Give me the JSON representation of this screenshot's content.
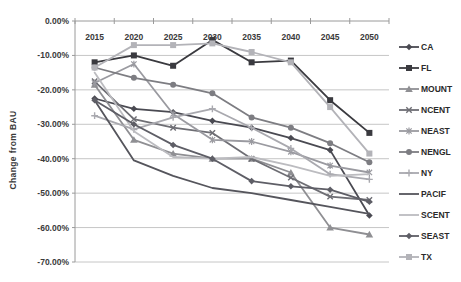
{
  "figure": {
    "background": "#ffffff",
    "grid_color": "#c6c6c6",
    "axis_color": "#9a9a9a",
    "tick_label_color": "#3a3a3a"
  },
  "chart_data": {
    "type": "line",
    "title": "",
    "xlabel": "",
    "ylabel": "Change from BAU",
    "x": [
      "2015",
      "2020",
      "2025",
      "2030",
      "2035",
      "2040",
      "2045",
      "2050"
    ],
    "y_ticks": [
      "0.00%",
      "-10.00%",
      "-20.00%",
      "-30.00%",
      "-40.00%",
      "-50.00%",
      "-60.00%",
      "-70.00%"
    ],
    "ylim": [
      -70,
      0
    ],
    "grid": "horizontal",
    "legend_position": "right",
    "series": [
      {
        "name": "CA",
        "marker": "diamond",
        "color": "#4a4a52",
        "values": [
          -22.5,
          -25.5,
          -26.5,
          -29.0,
          -31.0,
          -34.0,
          -37.5,
          -56.5
        ]
      },
      {
        "name": "FL",
        "marker": "square",
        "color": "#3a3a3f",
        "values": [
          -12.0,
          -10.0,
          -13.0,
          -5.5,
          -12.0,
          -11.5,
          -23.0,
          -32.5
        ]
      },
      {
        "name": "MOUNT",
        "marker": "triangle",
        "color": "#8f8f93",
        "values": [
          -18.5,
          -34.5,
          -38.5,
          -40.0,
          -40.0,
          -44.0,
          -60.0,
          -62.0
        ]
      },
      {
        "name": "NCENT",
        "marker": "x",
        "color": "#6e6e74",
        "values": [
          -17.5,
          -28.5,
          -31.0,
          -32.5,
          -40.0,
          -45.5,
          -51.0,
          -52.0
        ]
      },
      {
        "name": "NEAST",
        "marker": "star",
        "color": "#9a9aa0",
        "values": [
          -18.0,
          -12.5,
          -27.0,
          -34.5,
          -35.0,
          -38.0,
          -42.0,
          -44.0
        ]
      },
      {
        "name": "NENGL",
        "marker": "circle",
        "color": "#7d7d82",
        "values": [
          -13.5,
          -16.5,
          -18.5,
          -21.0,
          -28.0,
          -31.0,
          -35.5,
          -41.0
        ]
      },
      {
        "name": "NY",
        "marker": "plus",
        "color": "#a9a9af",
        "values": [
          -27.5,
          -31.5,
          -28.0,
          -25.5,
          -31.0,
          -37.0,
          -44.5,
          -46.0
        ]
      },
      {
        "name": "PACIF",
        "marker": "none",
        "color": "#55555c",
        "values": [
          -23.0,
          -40.5,
          -45.0,
          -48.5,
          -50.0,
          -52.0,
          -54.0,
          -56.0
        ]
      },
      {
        "name": "SCENT",
        "marker": "none",
        "color": "#bcbcc0",
        "values": [
          -15.0,
          -32.0,
          -39.5,
          -40.0,
          -39.5,
          -42.0,
          -45.0,
          -44.5
        ]
      },
      {
        "name": "SEAST",
        "marker": "diamond",
        "color": "#5e5e66",
        "values": [
          -23.0,
          -30.0,
          -36.0,
          -40.0,
          -46.5,
          -48.0,
          -49.0,
          -52.5
        ]
      },
      {
        "name": "TX",
        "marker": "square",
        "color": "#b3b3b8",
        "values": [
          -13.5,
          -7.0,
          -7.0,
          -6.5,
          -9.0,
          -12.0,
          -25.0,
          -38.5
        ]
      }
    ]
  }
}
